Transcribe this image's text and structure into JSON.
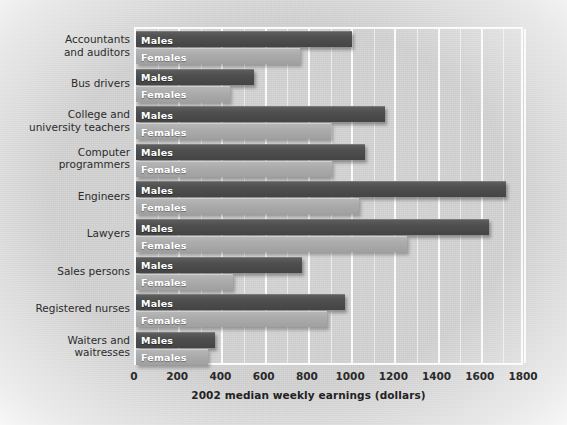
{
  "chart_data": {
    "type": "bar",
    "orientation": "horizontal",
    "title": "",
    "xlabel": "2002 median weekly earnings (dollars)",
    "ylabel": "",
    "xlim": [
      0,
      1800
    ],
    "xticks": [
      0,
      200,
      400,
      600,
      800,
      1000,
      1200,
      1400,
      1600,
      1800
    ],
    "grid": true,
    "grid_axis": "x",
    "minor_grid_step": 100,
    "legend": "in-bar labels",
    "categories": [
      "Accountants and auditors",
      "Bus drivers",
      "College and university teachers",
      "Computer programmers",
      "Engineers",
      "Lawyers",
      "Sales persons",
      "Registered nurses",
      "Waiters and waitresses"
    ],
    "series": [
      {
        "name": "Males",
        "color": "#4a4a4a",
        "values": [
          1000,
          545,
          1150,
          1060,
          1710,
          1635,
          770,
          965,
          365
        ]
      },
      {
        "name": "Females",
        "color": "#a9a9a9",
        "values": [
          760,
          435,
          900,
          905,
          1030,
          1255,
          450,
          885,
          335
        ]
      }
    ]
  },
  "category_lines": [
    [
      "Accountants",
      "and auditors"
    ],
    [
      "Bus drivers"
    ],
    [
      "College and",
      "university teachers"
    ],
    [
      "Computer",
      "programmers"
    ],
    [
      "Engineers"
    ],
    [
      "Lawyers"
    ],
    [
      "Sales persons"
    ],
    [
      "Registered nurses"
    ],
    [
      "Waiters and",
      "waitresses"
    ]
  ],
  "axis": {
    "title": "2002 median weekly earnings (dollars)",
    "tick_labels": [
      "0",
      "200",
      "400",
      "600",
      "800",
      "1000",
      "1200",
      "1400",
      "1600",
      "1800"
    ]
  },
  "series_labels": {
    "males": "Males",
    "females": "Females"
  },
  "colors": {
    "male_bar": "#4a4a4a",
    "female_bar": "#a9a9a9",
    "gridline": "#fafafa",
    "background": "#cfcfcf",
    "text": "#2c2c2c"
  }
}
